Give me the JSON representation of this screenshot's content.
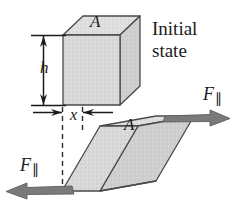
{
  "figure": {
    "labels": {
      "initial_state_line1": "Initial",
      "initial_state_line2": "state",
      "area_top": "A",
      "area_sheared": "A",
      "height": "h",
      "displacement": "x",
      "force_symbol": "F",
      "force_subscript": "∥"
    },
    "colors": {
      "face_front": "#d6d6d6",
      "face_top": "#dedede",
      "face_side": "#cfcfcf",
      "outline": "#4a4a4a",
      "arrow": "#6e6e6e",
      "dimension_line": "#1a1a1a",
      "dashed_line": "#2b2b2b",
      "text": "#1a1a1a",
      "background": "#ffffff"
    },
    "geometry": {
      "cube": {
        "front_face": [
          [
            63,
            35
          ],
          [
            120,
            35
          ],
          [
            120,
            105
          ],
          [
            63,
            105
          ]
        ],
        "depth_offset": [
          20,
          -19
        ],
        "note": "undeformed cube, initial state"
      },
      "sheared_block": {
        "front_face": [
          [
            62,
            191
          ],
          [
            100,
            126
          ],
          [
            168,
            126
          ],
          [
            130,
            191
          ]
        ],
        "depth_offset": [
          56,
          -10
        ],
        "note": "parallelepiped after shear, displaced by x at top"
      },
      "dimension_h": {
        "x": 43,
        "y_top": 35,
        "y_bottom": 105
      },
      "dimension_x": {
        "y": 112,
        "x_left": 62,
        "x_right": 82
      },
      "dashed_lines": [
        {
          "x": 62,
          "y1": 108,
          "y2": 193
        },
        {
          "x": 82,
          "y1": 108,
          "y2": 130
        }
      ],
      "force_arrow_top": {
        "from": [
          168,
          120
        ],
        "to": [
          228,
          120
        ],
        "direction": "right"
      },
      "force_arrow_bottom": {
        "from": [
          62,
          191
        ],
        "to": [
          6,
          191
        ],
        "direction": "left"
      }
    }
  }
}
